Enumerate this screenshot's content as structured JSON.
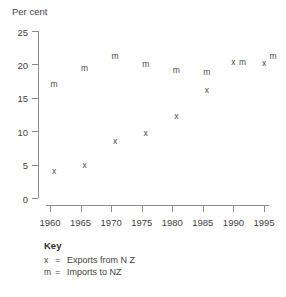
{
  "chart_data": {
    "type": "scatter",
    "title": "",
    "ylabel": "Per cent",
    "xlabel": "",
    "ylim": [
      0,
      25
    ],
    "xlim": [
      1958,
      1996
    ],
    "yticks": [
      0,
      5,
      10,
      15,
      20,
      25
    ],
    "xticks": [
      1960,
      1965,
      1970,
      1975,
      1980,
      1985,
      1990,
      1995
    ],
    "grid": false,
    "legend_position": "below-plot",
    "series": [
      {
        "name": "Exports from N Z",
        "marker": "x",
        "x": [
          1960,
          1965,
          1970,
          1975,
          1980,
          1985,
          1990,
          1995
        ],
        "values": [
          4,
          5,
          8.5,
          9.7,
          12.3,
          16.2,
          20.3,
          20.2
        ]
      },
      {
        "name": "Imports to NZ",
        "marker": "m",
        "x": [
          1960,
          1965,
          1970,
          1975,
          1980,
          1985,
          1990,
          1995
        ],
        "values": [
          17.1,
          19.4,
          21.3,
          20.1,
          19.2,
          18.9,
          20.4,
          21.2
        ]
      }
    ]
  },
  "key": {
    "title": "Key",
    "equals": "=",
    "rows": [
      {
        "symbol": "x",
        "label": "Exports from N Z"
      },
      {
        "symbol": "m",
        "label": "Imports to NZ"
      }
    ]
  },
  "axis": {
    "y_title": "Per cent",
    "y_labels": [
      "0",
      "5",
      "10",
      "15",
      "20",
      "25"
    ],
    "x_labels": [
      "1960",
      "1965",
      "1970",
      "1975",
      "1980",
      "1985",
      "1990",
      "1995"
    ]
  },
  "colors": {
    "axis": "#8b8b8b",
    "text": "#3f3f3f",
    "marker": "#4a4a4a",
    "background": "#ffffff"
  }
}
